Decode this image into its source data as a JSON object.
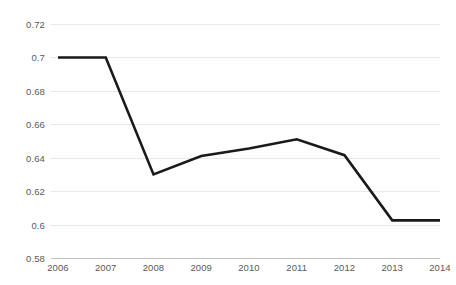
{
  "chart_data": {
    "type": "line",
    "title": "",
    "subtitle": "",
    "xlabel": "",
    "ylabel": "",
    "categories": [
      "2006",
      "2007",
      "2008",
      "2009",
      "2010",
      "2011",
      "2012",
      "2013",
      "2014"
    ],
    "values": [
      0.7,
      0.7,
      0.63,
      0.641,
      0.6455,
      0.651,
      0.6415,
      0.6025,
      0.6025
    ],
    "series": [
      {
        "name": "",
        "values": [
          0.7,
          0.7,
          0.63,
          0.641,
          0.6455,
          0.651,
          0.6415,
          0.6025,
          0.6025
        ]
      }
    ],
    "ylim": [
      0.58,
      0.72
    ],
    "xlim": [
      "2006",
      "2014"
    ],
    "ytick_labels": [
      "0.72",
      "0.7",
      "0.68",
      "0.66",
      "0.64",
      "0.62",
      "0.6",
      "0.58"
    ],
    "ytick_values": [
      0.72,
      0.7,
      0.68,
      0.66,
      0.64,
      0.62,
      0.6,
      0.58
    ],
    "ytick_step": 0.02,
    "grid": true,
    "grid_axis": "y",
    "legend": false,
    "legend_position": "none",
    "annotations": [],
    "colors": {
      "line": "#1a1a1a",
      "gridline": "#e9e9e9",
      "axis": "#bfbfbf",
      "tick_text": "#5a5a5a",
      "background": "#ffffff"
    }
  }
}
